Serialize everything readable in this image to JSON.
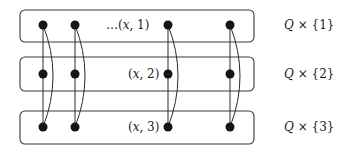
{
  "diagram": {
    "rows": [
      {
        "id": 1,
        "inner_label": "…(x, 1)",
        "side_label": "Q × {1}",
        "box": {
          "x": 20,
          "y": 10,
          "w": 234,
          "h": 32
        },
        "dot_y": 25
      },
      {
        "id": 2,
        "inner_label": "(x, 2)",
        "side_label": "Q × {2}",
        "box": {
          "x": 20,
          "y": 57,
          "w": 234,
          "h": 34
        },
        "dot_y": 74
      },
      {
        "id": 3,
        "inner_label": "(x, 3)",
        "side_label": "Q × {3}",
        "box": {
          "x": 20,
          "y": 111,
          "w": 234,
          "h": 33
        },
        "dot_y": 127
      }
    ],
    "columns_x": [
      43,
      75,
      168,
      230
    ],
    "edges": {
      "straight": "vertical line through rows 1–3 in each column",
      "curved": "arc from row 1 to row 3 bulging right in each column"
    },
    "colors": {
      "stroke": "#3a3a3a",
      "dot": "#151515",
      "background": "#ffffff"
    }
  },
  "labels": {
    "row1_inner_prefix": "…(",
    "row1_inner_x": "x",
    "row1_inner_suffix": ", 1)",
    "row2_inner_prefix": "(",
    "row2_inner_x": "x",
    "row2_inner_suffix": ", 2)",
    "row3_inner_prefix": "(",
    "row3_inner_x": "x",
    "row3_inner_suffix": ", 3)",
    "side_q": "Q",
    "side1_suffix": " × {1}",
    "side2_suffix": " × {2}",
    "side3_suffix": " × {3}"
  }
}
